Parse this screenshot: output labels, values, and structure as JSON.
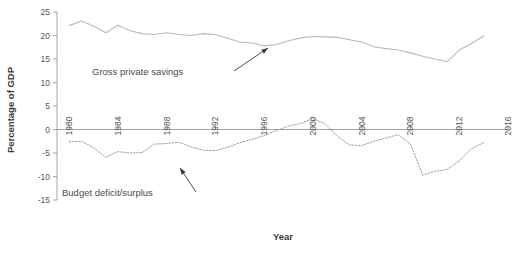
{
  "chart_data": {
    "type": "line",
    "title": "",
    "xlabel": "Year",
    "ylabel": "Percentage of GDP",
    "xlim": [
      1979,
      2016
    ],
    "ylim": [
      -15,
      25
    ],
    "ytick_values": [
      25,
      20,
      15,
      10,
      5,
      0,
      -5,
      -10,
      -15
    ],
    "ytick_labels": [
      "25",
      "20",
      "15",
      "10",
      "5",
      "0",
      "-5",
      "-10",
      "-15"
    ],
    "xtick_values": [
      1980,
      1984,
      1988,
      1992,
      1996,
      2000,
      2004,
      2008,
      2012,
      2016
    ],
    "xtick_labels": [
      "1980",
      "1984",
      "1988",
      "1992",
      "1996",
      "2000",
      "2004",
      "2008",
      "2012",
      "2016"
    ],
    "grid": false,
    "legend": "inline-annotations",
    "series": [
      {
        "name": "Gross private savings",
        "style": "solid",
        "color": "#b9b9b9",
        "x": [
          1980,
          1981,
          1982,
          1983,
          1984,
          1985,
          1986,
          1987,
          1988,
          1989,
          1990,
          1991,
          1992,
          1993,
          1994,
          1995,
          1996,
          1997,
          1998,
          1999,
          2000,
          2001,
          2002,
          2003,
          2004,
          2005,
          2006,
          2007,
          2008,
          2009,
          2010,
          2011,
          2012,
          2013,
          2014
        ],
        "values": [
          22.1,
          23.1,
          22.0,
          20.6,
          22.2,
          21.0,
          20.4,
          20.2,
          20.6,
          20.2,
          20.0,
          20.4,
          20.2,
          19.4,
          18.6,
          18.4,
          17.8,
          18.1,
          18.9,
          19.5,
          19.8,
          19.7,
          19.6,
          19.1,
          18.6,
          17.6,
          17.2,
          16.9,
          16.3,
          15.6,
          15.0,
          14.4,
          16.9,
          18.3,
          19.9
        ]
      },
      {
        "name": "Budget deficit/surplus",
        "style": "dotted",
        "color": "#9f9f9f",
        "x": [
          1980,
          1981,
          1982,
          1983,
          1984,
          1985,
          1986,
          1987,
          1988,
          1989,
          1990,
          1991,
          1992,
          1993,
          1994,
          1995,
          1996,
          1997,
          1998,
          1999,
          2000,
          2001,
          2002,
          2003,
          2004,
          2005,
          2006,
          2007,
          2008,
          2009,
          2010,
          2011,
          2012,
          2013,
          2014
        ],
        "values": [
          -2.6,
          -2.5,
          -3.9,
          -5.9,
          -4.7,
          -5.0,
          -4.9,
          -3.1,
          -3.0,
          -2.7,
          -3.7,
          -4.4,
          -4.5,
          -3.8,
          -2.8,
          -2.1,
          -1.3,
          -0.2,
          0.7,
          1.3,
          2.3,
          1.2,
          -1.4,
          -3.3,
          -3.4,
          -2.5,
          -1.8,
          -1.1,
          -3.1,
          -9.7,
          -8.9,
          -8.5,
          -6.7,
          -4.1,
          -2.8
        ]
      }
    ],
    "annotations": [
      {
        "name": "Gross private savings",
        "label_x": 92,
        "label_y": 75,
        "arrow_from_x": 234,
        "arrow_from_y": 71,
        "arrow_to_x": 268,
        "arrow_to_y": 48
      },
      {
        "name": "Budget deficit/surplus",
        "label_x": 62,
        "label_y": 196,
        "arrow_from_x": 196,
        "arrow_from_y": 192,
        "arrow_to_x": 180,
        "arrow_to_y": 168
      }
    ]
  }
}
